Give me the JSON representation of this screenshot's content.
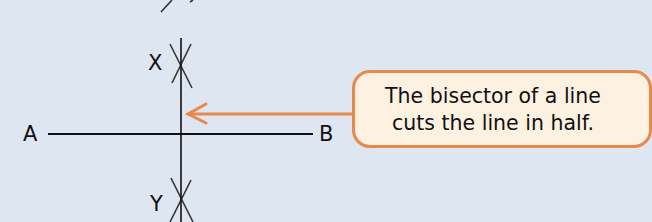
{
  "diagram": {
    "labels": {
      "a": "A",
      "b": "B",
      "x": "X",
      "y": "Y"
    },
    "callout": {
      "line1": "The bisector of a line",
      "line2": "cuts the line in half."
    },
    "colors": {
      "background": "#dde6f1",
      "line": "#111111",
      "arc": "#333333",
      "accent": "#e8894a",
      "callout_fill": "#fdf1e1"
    }
  }
}
